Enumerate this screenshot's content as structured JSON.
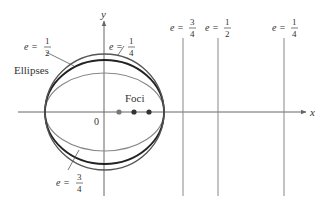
{
  "diagram": {
    "axes": {
      "x_label": "x",
      "y_label": "y",
      "origin_label": "0"
    },
    "ellipses_label": "Ellipses",
    "foci_label": "Foci",
    "eccentricities": [
      {
        "e": "1/4",
        "num": "1",
        "den": "4",
        "semi_minor_px": 58,
        "focus_x": 119,
        "directrix_x": 284,
        "stroke": "#555555",
        "width": 1.3
      },
      {
        "e": "1/2",
        "num": "1",
        "den": "2",
        "semi_minor_px": 52,
        "focus_x": 134,
        "directrix_x": 218,
        "stroke": "#222222",
        "width": 1.8
      },
      {
        "e": "3/4",
        "num": "3",
        "den": "4",
        "semi_minor_px": 39,
        "focus_x": 149,
        "directrix_x": 183,
        "stroke": "#777777",
        "width": 1.2
      }
    ],
    "labels": {
      "e_prefix": "e =",
      "e_quarter_num": "1",
      "e_quarter_den": "4",
      "e_half_num": "1",
      "e_half_den": "2",
      "e_three_quarter_num": "3",
      "e_three_quarter_den": "4"
    },
    "colors": {
      "axis": "#666666",
      "directrix": "#888888",
      "focus_dot_1": "#777777",
      "focus_dot_2": "#333333",
      "focus_dot_3": "#333333"
    }
  }
}
